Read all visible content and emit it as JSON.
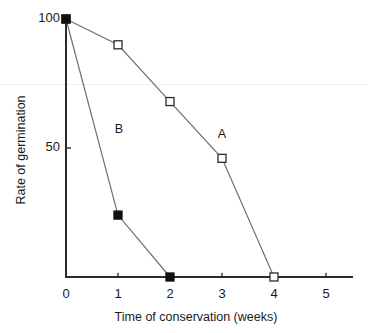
{
  "chart_data": {
    "type": "line",
    "title": "",
    "xlabel": "Time of conservation (weeks)",
    "ylabel": "Rate of germination",
    "xlim": [
      0,
      5.6
    ],
    "ylim": [
      0,
      100
    ],
    "xticks": [
      "0",
      "1",
      "2",
      "3",
      "4",
      "5"
    ],
    "xtick_values": [
      0,
      1,
      2,
      3,
      4,
      5
    ],
    "yticks": [
      "50",
      "100"
    ],
    "ytick_values": [
      50,
      100
    ],
    "grid": false,
    "legend": "inline-annotations",
    "series": [
      {
        "name": "A",
        "marker": "open-square",
        "label": "A",
        "x": [
          0,
          1,
          2,
          3,
          4
        ],
        "values": [
          100,
          90,
          68,
          46,
          0
        ]
      },
      {
        "name": "B",
        "marker": "filled-square",
        "label": "B",
        "x": [
          0,
          1,
          2
        ],
        "values": [
          100,
          24,
          0
        ]
      }
    ],
    "annotations": [
      {
        "text": "A",
        "x": 3.0,
        "y": 55
      },
      {
        "text": "B",
        "x": 1.02,
        "y": 57
      }
    ],
    "colors": {
      "axis": "#2b2b2b",
      "line": "#6e6e6e",
      "marker_open_fill": "#ffffff",
      "marker_filled_fill": "#111111",
      "background": "#ffffff"
    }
  }
}
